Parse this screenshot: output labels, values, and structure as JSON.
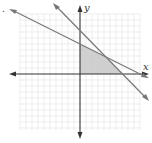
{
  "figure": {
    "marker": ".",
    "axes": {
      "x_label": "x",
      "y_label": "y"
    },
    "grid": {
      "x_min": -10,
      "x_max": 10,
      "y_min": -10,
      "y_max": 10,
      "unit_px": 6
    },
    "lines": [
      {
        "name": "x + y = 7",
        "x_intercept": 7,
        "y_intercept": 7
      },
      {
        "name": "x + 2y = 10",
        "x_intercept": 10,
        "y_intercept": 5
      }
    ],
    "shaded_region": {
      "vertices": [
        [
          0,
          0
        ],
        [
          0,
          5
        ],
        [
          4,
          3
        ],
        [
          7,
          0
        ]
      ],
      "color": "#c8c8c8"
    },
    "colors": {
      "axis": "#333333",
      "line": "#777777",
      "grid": "#e3e3e3"
    }
  }
}
